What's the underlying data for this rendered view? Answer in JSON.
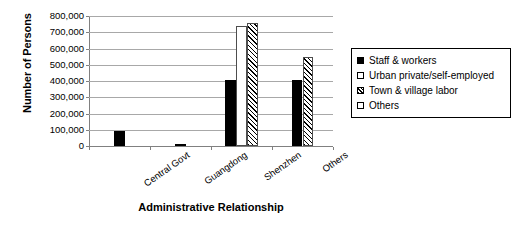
{
  "chart_data": {
    "type": "bar",
    "title": "",
    "xlabel": "Administrative Relationship",
    "ylabel": "Number of Persons",
    "categories": [
      "Central Govt",
      "Guangdong",
      "Shenzhen",
      "Others"
    ],
    "series": [
      {
        "name": "Staff & workers",
        "pattern": "solid",
        "values": [
          95000,
          15000,
          405000,
          405000
        ]
      },
      {
        "name": "Urban private/self-employed",
        "pattern": "open",
        "values": [
          0,
          0,
          740000,
          0
        ]
      },
      {
        "name": "Town & village labor",
        "pattern": "hatch",
        "values": [
          0,
          0,
          755000,
          545000
        ]
      },
      {
        "name": "Others",
        "pattern": "open",
        "values": [
          0,
          0,
          0,
          0
        ]
      }
    ],
    "ylim": [
      0,
      800000
    ],
    "ytick_step": 100000,
    "yticks": [
      0,
      100000,
      200000,
      300000,
      400000,
      500000,
      600000,
      700000,
      800000
    ],
    "ytick_labels": [
      "0",
      "100,000",
      "200,000",
      "300,000",
      "400,000",
      "500,000",
      "600,000",
      "700,000",
      "800,000"
    ],
    "grid": true,
    "legend_position": "right",
    "legend_entries": [
      {
        "label": "Staff & workers",
        "pattern": "solid"
      },
      {
        "label": "Urban private/self-employed",
        "pattern": "open"
      },
      {
        "label": "Town & village labor",
        "pattern": "hatch"
      },
      {
        "label": "Others",
        "pattern": "open"
      }
    ],
    "colors": {
      "solid": "#000000",
      "open": "#ffffff",
      "hatch_line": "#000000",
      "axis": "#808080",
      "grid": "#a8a8a8",
      "text": "#000000",
      "background": "#ffffff"
    }
  }
}
